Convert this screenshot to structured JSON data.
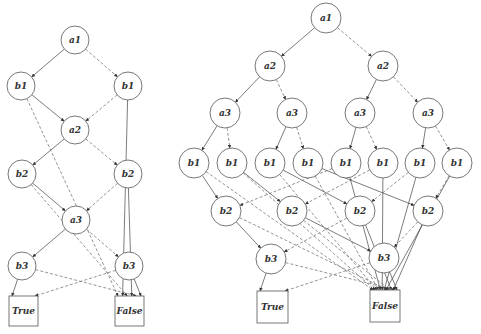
{
  "figure": {
    "diagrams": [
      {
        "name": "left-obdd",
        "radius": 14,
        "nodes": [
          {
            "id": "L_a1",
            "label": "a1",
            "x": 75,
            "y": 40
          },
          {
            "id": "L_b1a",
            "label": "b1",
            "x": 21,
            "y": 86
          },
          {
            "id": "L_b1b",
            "label": "b1",
            "x": 128,
            "y": 86
          },
          {
            "id": "L_a2",
            "label": "a2",
            "x": 75,
            "y": 130
          },
          {
            "id": "L_b2a",
            "label": "b2",
            "x": 22,
            "y": 174
          },
          {
            "id": "L_b2b",
            "label": "b2",
            "x": 128,
            "y": 174
          },
          {
            "id": "L_a3",
            "label": "a3",
            "x": 76,
            "y": 220
          },
          {
            "id": "L_b3a",
            "label": "b3",
            "x": 22,
            "y": 266
          },
          {
            "id": "L_b3b",
            "label": "b3",
            "x": 129,
            "y": 266
          }
        ],
        "terminals": [
          {
            "id": "L_T",
            "label": "True",
            "x": 9,
            "y": 296,
            "w": 29,
            "h": 30
          },
          {
            "id": "L_F",
            "label": "False",
            "x": 115,
            "y": 296,
            "w": 29,
            "h": 30
          }
        ],
        "edges": [
          {
            "from": "L_a1",
            "to": "L_b1a",
            "style": "solid"
          },
          {
            "from": "L_a1",
            "to": "L_b1b",
            "style": "dashed"
          },
          {
            "from": "L_b1a",
            "to": "L_a2",
            "style": "solid"
          },
          {
            "from": "L_b1a",
            "to": "L_F",
            "style": "dashed"
          },
          {
            "from": "L_b1b",
            "to": "L_a2",
            "style": "dashed"
          },
          {
            "from": "L_b1b",
            "to": "L_F",
            "style": "solid"
          },
          {
            "from": "L_a2",
            "to": "L_b2a",
            "style": "solid"
          },
          {
            "from": "L_a2",
            "to": "L_b2b",
            "style": "dashed"
          },
          {
            "from": "L_b2a",
            "to": "L_a3",
            "style": "solid"
          },
          {
            "from": "L_b2a",
            "to": "L_F",
            "style": "dashed"
          },
          {
            "from": "L_b2b",
            "to": "L_a3",
            "style": "dashed"
          },
          {
            "from": "L_b2b",
            "to": "L_F",
            "style": "solid"
          },
          {
            "from": "L_a3",
            "to": "L_b3a",
            "style": "solid"
          },
          {
            "from": "L_a3",
            "to": "L_b3b",
            "style": "dashed"
          },
          {
            "from": "L_b3a",
            "to": "L_T",
            "style": "solid"
          },
          {
            "from": "L_b3a",
            "to": "L_F",
            "style": "dashed"
          },
          {
            "from": "L_b3b",
            "to": "L_T",
            "style": "dashed"
          },
          {
            "from": "L_b3b",
            "to": "L_F",
            "style": "solid"
          }
        ]
      },
      {
        "name": "right-obdd",
        "radius": 15,
        "nodes": [
          {
            "id": "R_a1",
            "label": "a1",
            "x": 326,
            "y": 18
          },
          {
            "id": "R_a2a",
            "label": "a2",
            "x": 270,
            "y": 66
          },
          {
            "id": "R_a2b",
            "label": "a2",
            "x": 383,
            "y": 66
          },
          {
            "id": "R_a3a",
            "label": "a3",
            "x": 225,
            "y": 113
          },
          {
            "id": "R_a3b",
            "label": "a3",
            "x": 292,
            "y": 113
          },
          {
            "id": "R_a3c",
            "label": "a3",
            "x": 360,
            "y": 113
          },
          {
            "id": "R_a3d",
            "label": "a3",
            "x": 428,
            "y": 113
          },
          {
            "id": "R_b1_1",
            "label": "b1",
            "x": 194,
            "y": 163
          },
          {
            "id": "R_b1_2",
            "label": "b1",
            "x": 232,
            "y": 163
          },
          {
            "id": "R_b1_3",
            "label": "b1",
            "x": 270,
            "y": 163
          },
          {
            "id": "R_b1_4",
            "label": "b1",
            "x": 308,
            "y": 163
          },
          {
            "id": "R_b1_5",
            "label": "b1",
            "x": 346,
            "y": 163
          },
          {
            "id": "R_b1_6",
            "label": "b1",
            "x": 383,
            "y": 163
          },
          {
            "id": "R_b1_7",
            "label": "b1",
            "x": 420,
            "y": 163
          },
          {
            "id": "R_b1_8",
            "label": "b1",
            "x": 457,
            "y": 163
          },
          {
            "id": "R_b2a",
            "label": "b2",
            "x": 226,
            "y": 211
          },
          {
            "id": "R_b2b",
            "label": "b2",
            "x": 292,
            "y": 211
          },
          {
            "id": "R_b2c",
            "label": "b2",
            "x": 360,
            "y": 211
          },
          {
            "id": "R_b2d",
            "label": "b2",
            "x": 428,
            "y": 211
          },
          {
            "id": "R_b3a",
            "label": "b3",
            "x": 271,
            "y": 259
          },
          {
            "id": "R_b3b",
            "label": "b3",
            "x": 384,
            "y": 258
          }
        ],
        "terminals": [
          {
            "id": "R_T",
            "label": "True",
            "x": 257,
            "y": 291,
            "w": 31,
            "h": 32
          },
          {
            "id": "R_F",
            "label": "False",
            "x": 370,
            "y": 290,
            "w": 30,
            "h": 32
          }
        ],
        "edges": [
          {
            "from": "R_a1",
            "to": "R_a2a",
            "style": "solid"
          },
          {
            "from": "R_a1",
            "to": "R_a2b",
            "style": "dashed"
          },
          {
            "from": "R_a2a",
            "to": "R_a3a",
            "style": "solid"
          },
          {
            "from": "R_a2a",
            "to": "R_a3b",
            "style": "dashed"
          },
          {
            "from": "R_a2b",
            "to": "R_a3c",
            "style": "solid"
          },
          {
            "from": "R_a2b",
            "to": "R_a3d",
            "style": "dashed"
          },
          {
            "from": "R_a3a",
            "to": "R_b1_1",
            "style": "solid"
          },
          {
            "from": "R_a3a",
            "to": "R_b1_2",
            "style": "dashed"
          },
          {
            "from": "R_a3b",
            "to": "R_b1_3",
            "style": "solid"
          },
          {
            "from": "R_a3b",
            "to": "R_b1_4",
            "style": "dashed"
          },
          {
            "from": "R_a3c",
            "to": "R_b1_5",
            "style": "solid"
          },
          {
            "from": "R_a3c",
            "to": "R_b1_6",
            "style": "dashed"
          },
          {
            "from": "R_a3d",
            "to": "R_b1_7",
            "style": "solid"
          },
          {
            "from": "R_a3d",
            "to": "R_b1_8",
            "style": "dashed"
          },
          {
            "from": "R_b1_1",
            "to": "R_b2a",
            "style": "solid"
          },
          {
            "from": "R_b1_1",
            "to": "R_F",
            "style": "dashed"
          },
          {
            "from": "R_b1_2",
            "to": "R_b2b",
            "style": "solid"
          },
          {
            "from": "R_b1_2",
            "to": "R_F",
            "style": "dashed"
          },
          {
            "from": "R_b1_3",
            "to": "R_b2c",
            "style": "solid"
          },
          {
            "from": "R_b1_3",
            "to": "R_F",
            "style": "dashed"
          },
          {
            "from": "R_b1_4",
            "to": "R_b2d",
            "style": "solid"
          },
          {
            "from": "R_b1_4",
            "to": "R_F",
            "style": "dashed"
          },
          {
            "from": "R_b1_5",
            "to": "R_F",
            "style": "solid"
          },
          {
            "from": "R_b1_5",
            "to": "R_b2a",
            "style": "dashed"
          },
          {
            "from": "R_b1_6",
            "to": "R_F",
            "style": "solid"
          },
          {
            "from": "R_b1_6",
            "to": "R_b2b",
            "style": "dashed"
          },
          {
            "from": "R_b1_7",
            "to": "R_F",
            "style": "solid"
          },
          {
            "from": "R_b1_7",
            "to": "R_b2c",
            "style": "dashed"
          },
          {
            "from": "R_b1_8",
            "to": "R_F",
            "style": "solid"
          },
          {
            "from": "R_b1_8",
            "to": "R_b2d",
            "style": "dashed"
          },
          {
            "from": "R_b2a",
            "to": "R_b3a",
            "style": "solid"
          },
          {
            "from": "R_b2a",
            "to": "R_F",
            "style": "dashed"
          },
          {
            "from": "R_b2b",
            "to": "R_b3b",
            "style": "solid"
          },
          {
            "from": "R_b2b",
            "to": "R_F",
            "style": "dashed"
          },
          {
            "from": "R_b2c",
            "to": "R_F",
            "style": "solid"
          },
          {
            "from": "R_b2c",
            "to": "R_b3a",
            "style": "dashed"
          },
          {
            "from": "R_b2d",
            "to": "R_F",
            "style": "solid"
          },
          {
            "from": "R_b2d",
            "to": "R_b3b",
            "style": "dashed"
          },
          {
            "from": "R_b3a",
            "to": "R_T",
            "style": "solid"
          },
          {
            "from": "R_b3a",
            "to": "R_F",
            "style": "dashed"
          },
          {
            "from": "R_b3b",
            "to": "R_F",
            "style": "solid"
          },
          {
            "from": "R_b3b",
            "to": "R_T",
            "style": "dashed"
          }
        ]
      }
    ]
  }
}
